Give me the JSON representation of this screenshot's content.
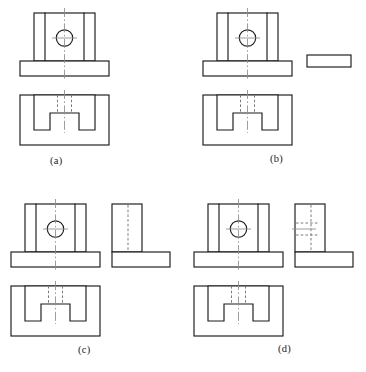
{
  "figure": {
    "kind": "engineering-orthographic-views",
    "background_color": "#ffffff",
    "line_colors": {
      "visible": "#1a1a1a",
      "hidden": "#7a7a7a",
      "center": "#8c8c8c"
    },
    "panels": [
      {
        "id": "a",
        "caption": "(a)",
        "views": [
          "front",
          "top"
        ],
        "has_side_view": false,
        "front_view": {
          "hole": true,
          "hole_centerline": "cross",
          "vertical_edges": 2,
          "base_plate": true
        },
        "top_view": {
          "slot": "U-shaped",
          "hidden_lines": 2,
          "centerline": true
        }
      },
      {
        "id": "b",
        "caption": "(b)",
        "views": [
          "front",
          "top",
          "side"
        ],
        "has_side_view": true,
        "side_view_shape": "thin-horizontal-rectangle",
        "front_view": {
          "hole": true,
          "hole_centerline": "cross",
          "vertical_edges": 2,
          "base_plate": true
        },
        "top_view": {
          "slot": "U-shaped",
          "hidden_lines": 2,
          "centerline": true
        }
      },
      {
        "id": "c",
        "caption": "(c)",
        "views": [
          "front",
          "top",
          "side"
        ],
        "has_side_view": true,
        "side_view_shape": "L-shape-with-vertical-hidden-line",
        "front_view": {
          "hole": true,
          "hole_centerline": "cross",
          "vertical_edges": 2,
          "base_plate": true
        },
        "top_view": {
          "slot": "U-shaped",
          "hidden_lines": 2,
          "centerline": true
        }
      },
      {
        "id": "d",
        "caption": "(d)",
        "views": [
          "front",
          "top",
          "side"
        ],
        "has_side_view": true,
        "side_view_shape": "L-shape-with-vertical-and-horizontal-hidden-lines",
        "front_view": {
          "hole": true,
          "hole_centerline": "cross",
          "vertical_edges": 2,
          "base_plate": true
        },
        "top_view": {
          "slot": "U-shaped",
          "hidden_lines": 2,
          "centerline": true
        },
        "side_view": {
          "hole_hidden_lines": 2,
          "hole_centerline": true
        }
      }
    ]
  }
}
